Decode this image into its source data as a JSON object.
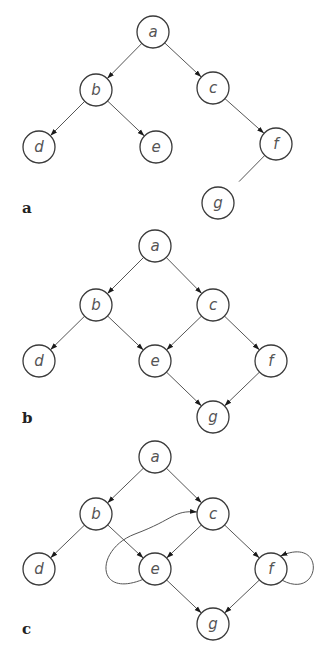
{
  "figure": {
    "node_radius": 16,
    "stroke_color": "#3a3a3a",
    "edge_color": "#555555",
    "panels": [
      {
        "label": "a",
        "label_pos": [
          22,
          213
        ],
        "description": "tree",
        "nodes": [
          {
            "id": "a",
            "label": "a",
            "x": 153,
            "y": 32
          },
          {
            "id": "b",
            "label": "b",
            "x": 96,
            "y": 90
          },
          {
            "id": "c",
            "label": "c",
            "x": 213,
            "y": 88
          },
          {
            "id": "d",
            "label": "d",
            "x": 39,
            "y": 147
          },
          {
            "id": "e",
            "label": "e",
            "x": 156,
            "y": 147
          },
          {
            "id": "f",
            "label": "f",
            "x": 276,
            "y": 144
          },
          {
            "id": "g",
            "label": "g",
            "x": 218,
            "y": 203
          }
        ],
        "edges": [
          {
            "from": "a",
            "to": "b",
            "directed": true
          },
          {
            "from": "a",
            "to": "c",
            "directed": true
          },
          {
            "from": "b",
            "to": "d",
            "directed": true
          },
          {
            "from": "b",
            "to": "e",
            "directed": true
          },
          {
            "from": "c",
            "to": "f",
            "directed": true
          },
          {
            "from": "f",
            "to": "g",
            "directed": false,
            "note": "undirected line, does not reach g"
          }
        ]
      },
      {
        "label": "b",
        "label_pos": [
          22,
          423
        ],
        "description": "directed acyclic graph",
        "nodes": [
          {
            "id": "a",
            "label": "a",
            "x": 155,
            "y": 246
          },
          {
            "id": "b",
            "label": "b",
            "x": 96,
            "y": 305
          },
          {
            "id": "c",
            "label": "c",
            "x": 213,
            "y": 305
          },
          {
            "id": "d",
            "label": "d",
            "x": 39,
            "y": 361
          },
          {
            "id": "e",
            "label": "e",
            "x": 155,
            "y": 361
          },
          {
            "id": "f",
            "label": "f",
            "x": 271,
            "y": 361
          },
          {
            "id": "g",
            "label": "g",
            "x": 213,
            "y": 417
          }
        ],
        "edges": [
          {
            "from": "a",
            "to": "b",
            "directed": true
          },
          {
            "from": "a",
            "to": "c",
            "directed": true
          },
          {
            "from": "b",
            "to": "d",
            "directed": true
          },
          {
            "from": "b",
            "to": "e",
            "directed": true
          },
          {
            "from": "c",
            "to": "e",
            "directed": true
          },
          {
            "from": "c",
            "to": "f",
            "directed": true
          },
          {
            "from": "e",
            "to": "g",
            "directed": true
          },
          {
            "from": "f",
            "to": "g",
            "directed": true
          }
        ]
      },
      {
        "label": "c",
        "label_pos": [
          22,
          634
        ],
        "description": "directed graph with cycles",
        "nodes": [
          {
            "id": "a",
            "label": "a",
            "x": 155,
            "y": 457
          },
          {
            "id": "b",
            "label": "b",
            "x": 96,
            "y": 514
          },
          {
            "id": "c",
            "label": "c",
            "x": 213,
            "y": 514
          },
          {
            "id": "d",
            "label": "d",
            "x": 39,
            "y": 569
          },
          {
            "id": "e",
            "label": "e",
            "x": 155,
            "y": 569
          },
          {
            "id": "f",
            "label": "f",
            "x": 271,
            "y": 569
          },
          {
            "id": "g",
            "label": "g",
            "x": 213,
            "y": 624
          }
        ],
        "edges": [
          {
            "from": "a",
            "to": "b",
            "directed": true
          },
          {
            "from": "a",
            "to": "c",
            "directed": true
          },
          {
            "from": "b",
            "to": "d",
            "directed": true
          },
          {
            "from": "b",
            "to": "e",
            "directed": true
          },
          {
            "from": "c",
            "to": "e",
            "directed": true
          },
          {
            "from": "c",
            "to": "f",
            "directed": true
          },
          {
            "from": "e",
            "to": "g",
            "directed": true
          },
          {
            "from": "f",
            "to": "g",
            "directed": true
          },
          {
            "from": "e",
            "to": "c",
            "directed": true,
            "curved": true
          },
          {
            "from": "f",
            "to": "f",
            "directed": true,
            "self_loop": true
          }
        ]
      }
    ]
  }
}
